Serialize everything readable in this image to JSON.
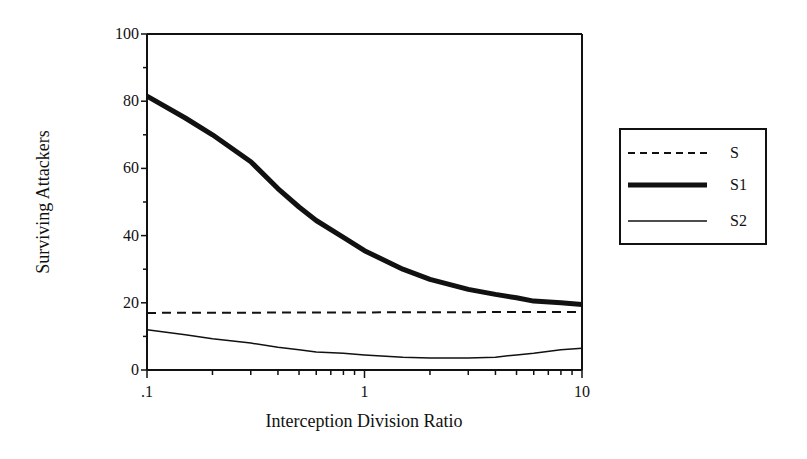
{
  "chart_data": {
    "type": "line",
    "title": "",
    "xlabel": "Interception Division Ratio",
    "ylabel": "Surviving Attackers",
    "xscale": "log",
    "xlim": [
      0.1,
      10
    ],
    "ylim": [
      0,
      100
    ],
    "xticks": [
      ".1",
      "1",
      "10"
    ],
    "yticks": [
      "0",
      "20",
      "40",
      "60",
      "80",
      "100"
    ],
    "grid": false,
    "legend_position": "right",
    "series": [
      {
        "name": "S",
        "style": "dashed",
        "width": 2,
        "x": [
          0.1,
          10
        ],
        "y": [
          17,
          17.3
        ]
      },
      {
        "name": "S1",
        "style": "solid-thick",
        "width": 5,
        "x": [
          0.1,
          0.15,
          0.2,
          0.3,
          0.4,
          0.5,
          0.6,
          0.8,
          1.0,
          1.5,
          2.0,
          3.0,
          4.0,
          5.0,
          6.0,
          8.0,
          10.0
        ],
        "y": [
          81.5,
          75,
          70,
          62,
          54,
          48.5,
          44.5,
          39.5,
          35.5,
          30,
          27,
          24,
          22.5,
          21.5,
          20.5,
          20,
          19.5
        ]
      },
      {
        "name": "S2",
        "style": "solid-thin",
        "width": 1.5,
        "x": [
          0.1,
          0.15,
          0.2,
          0.3,
          0.4,
          0.5,
          0.6,
          0.8,
          1.0,
          1.5,
          2.0,
          3.0,
          4.0,
          5.0,
          6.0,
          8.0,
          10.0
        ],
        "y": [
          12,
          10.5,
          9.3,
          8,
          6.8,
          6,
          5.4,
          5,
          4.5,
          3.8,
          3.6,
          3.6,
          3.8,
          4.5,
          5,
          6,
          6.5
        ]
      }
    ]
  }
}
